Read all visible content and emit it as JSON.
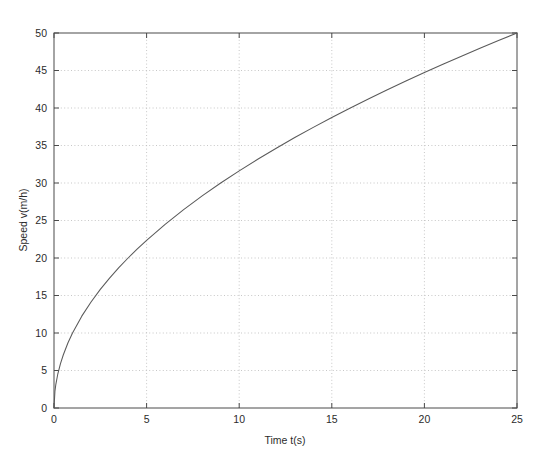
{
  "figure": {
    "background_color": "#ffffff",
    "axes_color": "#4a4a4a",
    "grid_color": "#b9b9b9",
    "curve_color": "#5a5a5a"
  },
  "chart_data": {
    "type": "line",
    "title": "",
    "xlabel": "Time t(s)",
    "ylabel": "Speed v(m/h)",
    "xlim": [
      0,
      25
    ],
    "ylim": [
      0,
      50
    ],
    "xticks": [
      0,
      5,
      10,
      15,
      20,
      25
    ],
    "yticks": [
      0,
      5,
      10,
      15,
      20,
      25,
      30,
      35,
      40,
      45,
      50
    ],
    "xtick_labels": [
      "0",
      "5",
      "10",
      "15",
      "20",
      "25"
    ],
    "ytick_labels": [
      "0",
      "5",
      "10",
      "15",
      "20",
      "25",
      "30",
      "35",
      "40",
      "45",
      "50"
    ],
    "grid": true,
    "grid_style": "dotted",
    "legend": null,
    "series": [
      {
        "name": "Speed",
        "x": [
          0,
          0.05,
          0.1,
          0.2,
          0.35,
          0.5,
          0.75,
          1,
          1.5,
          2,
          2.5,
          3,
          3.5,
          4,
          4.5,
          5,
          6,
          7,
          8,
          9,
          10,
          11,
          12,
          13,
          14,
          15,
          16,
          17,
          18,
          19,
          20,
          21,
          22,
          23,
          24,
          25
        ],
        "y": [
          0,
          2.24,
          3.16,
          4.47,
          5.92,
          7.07,
          8.66,
          10.0,
          12.25,
          14.14,
          15.81,
          17.32,
          18.71,
          20.0,
          21.21,
          22.36,
          24.49,
          26.46,
          28.28,
          30.0,
          31.62,
          33.17,
          34.64,
          36.06,
          37.42,
          38.73,
          40.0,
          41.23,
          42.43,
          43.59,
          44.72,
          45.83,
          46.9,
          47.96,
          48.99,
          50.0
        ]
      }
    ]
  }
}
